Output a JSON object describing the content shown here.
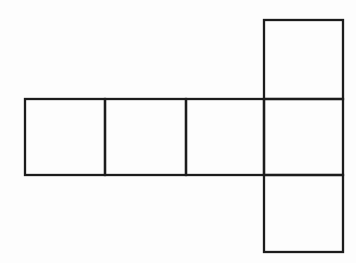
{
  "figure": {
    "canvas": {
      "width": 356,
      "height": 263,
      "background": "#fdfdfd"
    },
    "net": {
      "stroke_color": "#1c1c1c",
      "stroke_width": 2.3,
      "fill": "none",
      "squares": [
        {
          "name": "row-square-1",
          "x": 25,
          "y": 99,
          "width": 80,
          "height": 76
        },
        {
          "name": "row-square-2",
          "x": 105,
          "y": 99,
          "width": 81,
          "height": 76
        },
        {
          "name": "row-square-3",
          "x": 186,
          "y": 99,
          "width": 78,
          "height": 76
        },
        {
          "name": "row-square-4",
          "x": 264,
          "y": 99,
          "width": 79,
          "height": 76
        },
        {
          "name": "top-flap-square",
          "x": 264,
          "y": 20,
          "width": 79,
          "height": 79
        },
        {
          "name": "bottom-flap-square",
          "x": 264,
          "y": 175,
          "width": 79,
          "height": 77
        }
      ]
    }
  }
}
